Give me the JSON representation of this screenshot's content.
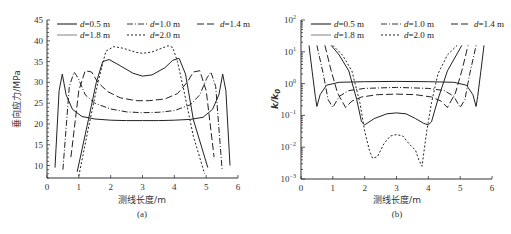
{
  "figure": {
    "legend_entries": [
      "d=0.5 m",
      "d=1.0 m",
      "d=1.4 m",
      "d=1.8 m",
      "d=2.0 m"
    ],
    "series_styles": [
      {
        "name": "d=0.5 m",
        "dash": "",
        "color": "#222222",
        "width": 1.1
      },
      {
        "name": "d=1.0 m",
        "dash": "6 2 1 2",
        "color": "#222222",
        "width": 0.9
      },
      {
        "name": "d=1.4 m",
        "dash": "7 3",
        "color": "#222222",
        "width": 1.0
      },
      {
        "name": "d=1.8 m",
        "dash": "",
        "color": "#777777",
        "width": 0.9
      },
      {
        "name": "d=2.0 m",
        "dash": "2 2",
        "color": "#222222",
        "width": 1.0
      }
    ]
  },
  "chart_data": [
    {
      "id": "a",
      "type": "line",
      "caption": "(a)",
      "title": "",
      "xlabel": "测线长度/m",
      "ylabel": "垂向应力/MPa",
      "xlim": [
        0,
        6
      ],
      "ylim": [
        7,
        45
      ],
      "xticks": [
        0,
        1,
        2,
        3,
        4,
        5,
        6
      ],
      "yticks": [
        10,
        15,
        20,
        25,
        30,
        35,
        40,
        45
      ],
      "yscale": "linear",
      "grid": false,
      "legend_position": "top, inside, 3 columns",
      "series": [
        {
          "name": "d=0.5 m",
          "x": [
            0.25,
            0.38,
            0.48,
            0.6,
            0.8,
            1.1,
            1.5,
            2,
            2.5,
            3,
            3.5,
            4,
            4.5,
            4.9,
            5.2,
            5.4,
            5.52,
            5.62,
            5.75
          ],
          "y": [
            9.5,
            28,
            32,
            27,
            23.5,
            21.8,
            21.2,
            20.9,
            20.8,
            20.8,
            20.8,
            20.9,
            21.1,
            21.6,
            23.5,
            27,
            32,
            28,
            10
          ]
        },
        {
          "name": "d=1.0 m",
          "x": [
            0.5,
            0.7,
            0.85,
            0.98,
            1.2,
            1.5,
            2,
            2.5,
            3,
            3.5,
            4,
            4.5,
            4.8,
            5.02,
            5.15,
            5.3,
            5.5
          ],
          "y": [
            9,
            29,
            32.5,
            31,
            27,
            25,
            23.6,
            22.9,
            22.7,
            22.8,
            23.2,
            24.6,
            27,
            31,
            32.5,
            29,
            9
          ]
        },
        {
          "name": "d=1.4 m",
          "x": [
            0.75,
            1.0,
            1.2,
            1.4,
            1.6,
            1.9,
            2.3,
            2.8,
            3.2,
            3.7,
            4.1,
            4.4,
            4.6,
            4.8,
            5.0,
            5.25
          ],
          "y": [
            12,
            28,
            32.8,
            32.5,
            30,
            27.8,
            26.3,
            25.6,
            25.6,
            26,
            27.3,
            30,
            32.5,
            32.8,
            28,
            12
          ]
        },
        {
          "name": "d=1.8 m",
          "x": [
            0.95,
            1.3,
            1.55,
            1.75,
            1.95,
            2.3,
            2.7,
            3.0,
            3.3,
            3.7,
            3.95,
            4.15,
            4.35,
            4.6,
            5.05
          ],
          "y": [
            8.5,
            21,
            30,
            35,
            35.5,
            34,
            32.2,
            31.5,
            31.8,
            33.5,
            35.3,
            35.8,
            32,
            21,
            9.5
          ]
        },
        {
          "name": "d=2.0 m",
          "x": [
            1.0,
            1.3,
            1.6,
            1.85,
            2.1,
            2.4,
            2.8,
            3.0,
            3.3,
            3.6,
            3.8,
            3.95,
            4.1,
            4.3,
            4.6,
            4.95
          ],
          "y": [
            7.5,
            19,
            30,
            37.5,
            38.6,
            38.2,
            37.2,
            37,
            37.3,
            38.2,
            38.8,
            38.4,
            35,
            28,
            17,
            8
          ]
        }
      ]
    },
    {
      "id": "b",
      "type": "line",
      "caption": "(b)",
      "title": "",
      "xlabel": "测线长度/m",
      "ylabel": "k/k0",
      "xlim": [
        0,
        6
      ],
      "ylim": [
        0.001,
        100
      ],
      "xticks": [
        0,
        1,
        2,
        3,
        4,
        5,
        6
      ],
      "yticks": [
        "10^-3",
        "10^-2",
        "10^-1",
        "10^0",
        "10^1",
        "10^2"
      ],
      "yscale": "log",
      "grid": false,
      "legend_position": "top, inside, 3 columns",
      "series": [
        {
          "name": "d=0.5 m",
          "x": [
            0.25,
            0.35,
            0.45,
            0.5,
            0.6,
            0.8,
            1.2,
            2,
            3,
            4,
            4.8,
            5.2,
            5.4,
            5.5,
            5.55,
            5.65,
            5.75
          ],
          "log10y": [
            1.2,
            0.4,
            -0.4,
            -0.72,
            -0.35,
            -0.05,
            0.04,
            0.06,
            0.07,
            0.06,
            0.04,
            -0.05,
            -0.35,
            -0.72,
            -0.4,
            0.4,
            1.2
          ]
        },
        {
          "name": "d=1.0 m",
          "x": [
            0.5,
            0.7,
            0.85,
            1.0,
            1.2,
            1.5,
            2,
            3,
            4,
            4.5,
            4.8,
            5.0,
            5.15,
            5.3,
            5.5
          ],
          "log10y": [
            1.2,
            0.3,
            -0.5,
            -0.75,
            -0.4,
            -0.22,
            -0.15,
            -0.12,
            -0.15,
            -0.22,
            -0.4,
            -0.75,
            -0.5,
            0.3,
            1.2
          ]
        },
        {
          "name": "d=1.4 m",
          "x": [
            0.75,
            0.95,
            1.15,
            1.4,
            1.6,
            1.9,
            2.4,
            3,
            3.6,
            4.1,
            4.4,
            4.6,
            4.85,
            5.05,
            5.25
          ],
          "log10y": [
            1.2,
            0.4,
            -0.3,
            -0.75,
            -0.55,
            -0.42,
            -0.35,
            -0.33,
            -0.35,
            -0.42,
            -0.55,
            -0.75,
            -0.3,
            0.4,
            1.2
          ]
        },
        {
          "name": "d=1.8 m",
          "x": [
            0.95,
            1.2,
            1.5,
            1.75,
            1.9,
            2.0,
            2.3,
            2.7,
            3.0,
            3.3,
            3.6,
            3.85,
            4.0,
            4.1,
            4.3,
            4.6,
            5.05
          ],
          "log10y": [
            1.2,
            0.9,
            0.4,
            -0.5,
            -1.2,
            -1.3,
            -1.1,
            -0.95,
            -0.92,
            -0.95,
            -1.1,
            -1.25,
            -1.3,
            -1.2,
            -0.5,
            0.4,
            1.2
          ]
        },
        {
          "name": "d=2.0 m",
          "x": [
            1.0,
            1.3,
            1.6,
            1.85,
            2.0,
            2.15,
            2.25,
            2.4,
            2.6,
            2.8,
            3.0,
            3.2,
            3.4,
            3.6,
            3.7,
            3.8,
            3.95,
            4.1,
            4.3,
            4.6,
            4.9
          ],
          "log10y": [
            1.2,
            0.9,
            0.4,
            -0.6,
            -1.5,
            -2.1,
            -2.35,
            -2.3,
            -1.9,
            -1.65,
            -1.6,
            -1.65,
            -1.9,
            -2.1,
            -2.4,
            -2.6,
            -1.5,
            -0.6,
            0.3,
            0.9,
            1.2
          ]
        }
      ]
    }
  ]
}
